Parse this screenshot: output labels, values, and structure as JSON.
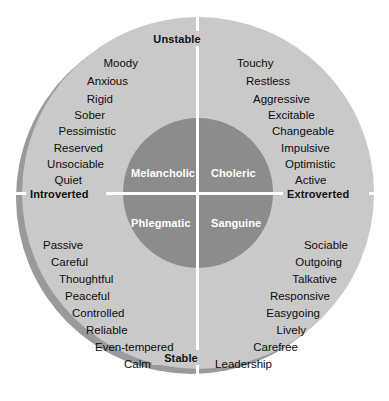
{
  "diagram": {
    "colors": {
      "outer_ring": "#c9c9c9",
      "inner_disc": "#8c8c8c",
      "axis_line": "#ffffff",
      "shadow": "#9a9a9a",
      "trait_text": "#0d0d0d",
      "temperament_text": "#ffffff"
    },
    "axes": {
      "vertical": {
        "top_pole": "Unstable",
        "bottom_pole": "Stable"
      },
      "horizontal": {
        "left_pole": "Introverted",
        "right_pole": "Extroverted"
      }
    },
    "quadrants": [
      {
        "id": "melancholic",
        "name": "Melancholic",
        "position": "top-left",
        "poles": [
          "Introverted",
          "Unstable"
        ],
        "traits": [
          "Moody",
          "Anxious",
          "Rigid",
          "Sober",
          "Pessimistic",
          "Reserved",
          "Unsociable",
          "Quiet"
        ]
      },
      {
        "id": "choleric",
        "name": "Choleric",
        "position": "top-right",
        "poles": [
          "Extroverted",
          "Unstable"
        ],
        "traits": [
          "Touchy",
          "Restless",
          "Aggressive",
          "Excitable",
          "Changeable",
          "Impulsive",
          "Optimistic",
          "Active"
        ]
      },
      {
        "id": "phlegmatic",
        "name": "Phlegmatic",
        "position": "bottom-left",
        "poles": [
          "Introverted",
          "Stable"
        ],
        "traits": [
          "Passive",
          "Careful",
          "Thoughtful",
          "Peaceful",
          "Controlled",
          "Reliable",
          "Even-tempered",
          "Calm"
        ]
      },
      {
        "id": "sanguine",
        "name": "Sanguine",
        "position": "bottom-right",
        "poles": [
          "Extroverted",
          "Stable"
        ],
        "traits": [
          "Sociable",
          "Outgoing",
          "Talkative",
          "Responsive",
          "Easygoing",
          "Lively",
          "Carefree",
          "Leadership"
        ]
      }
    ]
  },
  "layout": {
    "melancholic_offsets": [
      {
        "x": 138,
        "y": 58
      },
      {
        "x": 128,
        "y": 76
      },
      {
        "x": 113,
        "y": 94
      },
      {
        "x": 105,
        "y": 110
      },
      {
        "x": 116,
        "y": 126
      },
      {
        "x": 103,
        "y": 143
      },
      {
        "x": 104,
        "y": 159
      },
      {
        "x": 82,
        "y": 175
      }
    ],
    "choleric_offsets": [
      {
        "x": 237,
        "y": 58
      },
      {
        "x": 246,
        "y": 76
      },
      {
        "x": 253,
        "y": 94
      },
      {
        "x": 268,
        "y": 110
      },
      {
        "x": 272,
        "y": 126
      },
      {
        "x": 281,
        "y": 143
      },
      {
        "x": 285,
        "y": 159
      },
      {
        "x": 295,
        "y": 175
      }
    ],
    "phlegmatic_offsets": [
      {
        "x": 43,
        "y": 240
      },
      {
        "x": 51,
        "y": 257
      },
      {
        "x": 59,
        "y": 274
      },
      {
        "x": 65,
        "y": 291
      },
      {
        "x": 72,
        "y": 308
      },
      {
        "x": 86,
        "y": 325
      },
      {
        "x": 95,
        "y": 342
      },
      {
        "x": 124,
        "y": 359
      }
    ],
    "sanguine_offsets": [
      {
        "x": 348,
        "y": 240
      },
      {
        "x": 342,
        "y": 257
      },
      {
        "x": 337,
        "y": 274
      },
      {
        "x": 330,
        "y": 291
      },
      {
        "x": 320,
        "y": 308
      },
      {
        "x": 306,
        "y": 325
      },
      {
        "x": 298,
        "y": 342
      },
      {
        "x": 272,
        "y": 359
      }
    ]
  }
}
